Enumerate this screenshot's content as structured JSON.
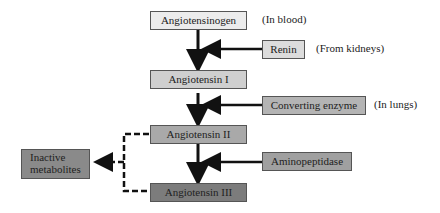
{
  "nodes": {
    "angiotensinogen": {
      "label": "Angiotensinogen",
      "fill": "#ececec"
    },
    "angiotensin1": {
      "label": "Angiotensin I",
      "fill": "#cfcfcf"
    },
    "angiotensin2": {
      "label": "Angiotensin II",
      "fill": "#a9a9a9"
    },
    "angiotensin3": {
      "label": "Angiotensin III",
      "fill": "#7c7c7c"
    },
    "inactive": {
      "label": "Inactive metabolites",
      "fill": "#8a8a8a"
    }
  },
  "enzymes": {
    "renin": {
      "label": "Renin",
      "note": "(From kidneys)",
      "fill": "#dcdcdc"
    },
    "converting": {
      "label": "Converting enzyme",
      "note": "(In lungs)",
      "fill": "#b4b4b4"
    },
    "aminopeptidase": {
      "label": "Aminopeptidase",
      "note": "",
      "fill": "#a0a0a0"
    }
  },
  "notes": {
    "angiotensinogen": "(In blood)"
  }
}
